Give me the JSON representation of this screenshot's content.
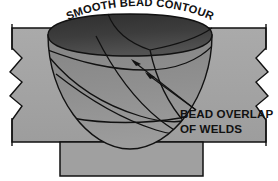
{
  "figure": {
    "name": "weld-bead-contour-cross-section",
    "background_color": "#ffffff",
    "width": 278,
    "height": 181
  },
  "labels": {
    "top_arc": "SMOOTH BEAD CONTOUR",
    "callout_line1": "BEAD OVERLAP",
    "callout_line2": "OF WELDS"
  },
  "colors": {
    "plate_fill": "#a3a3a3",
    "plate_fill_light": "#adadad",
    "backing_bar_fill": "#a0a0a0",
    "bead_top_dark": "#3a3a3a",
    "bead_top_dark2": "#474747",
    "bowl_fill": "#8e8e8e",
    "bowl_fill_light": "#9a9a9a",
    "outline": "#111111",
    "text": "#111111",
    "page": "#ffffff"
  },
  "parts": [
    {
      "id": "left-plate",
      "label": "left base metal plate"
    },
    {
      "id": "right-plate",
      "label": "right base metal plate"
    },
    {
      "id": "backing-bar",
      "label": "backing bar"
    },
    {
      "id": "weld-groove",
      "label": "weld groove bowl"
    },
    {
      "id": "bead-top-surface",
      "label": "smooth bead top surface"
    },
    {
      "id": "bead-overlap-curves",
      "label": "overlapping weld bead passes"
    },
    {
      "id": "left-break-symbol",
      "label": "left break line"
    },
    {
      "id": "right-break-symbol",
      "label": "right break line"
    },
    {
      "id": "leader-upper",
      "label": "upper leader line with arrowhead"
    },
    {
      "id": "leader-lower",
      "label": "lower leader line with arrowhead"
    }
  ]
}
